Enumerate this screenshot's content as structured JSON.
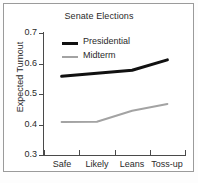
{
  "chart_data": {
    "type": "line",
    "title": "Senate Elections",
    "xlabel": "",
    "ylabel": "Expected Turnout",
    "categories": [
      "Safe",
      "Likely",
      "Leans",
      "Toss-up"
    ],
    "ylim": [
      0.3,
      0.7
    ],
    "yticks": [
      "0.3",
      "0.4",
      "0.5",
      "0.6",
      "0.7"
    ],
    "ytick_values": [
      0.3,
      0.4,
      0.5,
      0.6,
      0.7
    ],
    "grid": false,
    "legend_position": "upper-left-inside",
    "series": [
      {
        "name": "Presidential",
        "color": "#111111",
        "width": 3,
        "values": [
          0.558,
          0.568,
          0.578,
          0.612
        ]
      },
      {
        "name": "Midterm",
        "color": "#a3a3a3",
        "width": 2,
        "values": [
          0.408,
          0.409,
          0.445,
          0.467
        ]
      }
    ]
  },
  "figure": {
    "border_color": "#9b9b9b",
    "axis_color": "#4a4a4a",
    "background": "#ffffff"
  }
}
